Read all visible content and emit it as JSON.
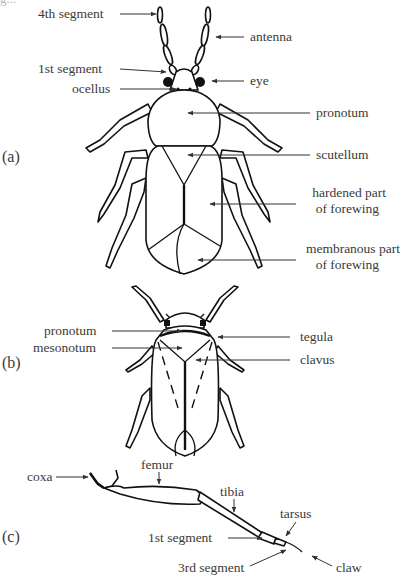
{
  "figure": {
    "cut_text": "g...",
    "panels": [
      {
        "tag": "(a)",
        "labels": {
          "fourth_segment": "4th segment",
          "antenna": "antenna",
          "first_segment": "1st segment",
          "eye": "eye",
          "ocellus": "ocellus",
          "pronotum": "pronotum",
          "scutellum": "scutellum",
          "hardened_1": "hardened part",
          "hardened_2": "of forewing",
          "membranous_1": "membranous part",
          "membranous_2": "of forewing"
        }
      },
      {
        "tag": "(b)",
        "labels": {
          "pronotum": "pronotum",
          "mesonotum": "mesonotum",
          "tegula": "tegula",
          "clavus": "clavus"
        }
      },
      {
        "tag": "(c)",
        "labels": {
          "coxa": "coxa",
          "femur": "femur",
          "tibia": "tibia",
          "tarsus": "tarsus",
          "first_segment": "1st segment",
          "third_segment": "3rd segment",
          "claw": "claw"
        }
      }
    ],
    "colors": {
      "line": "#111111",
      "label_text": "#3a3a3a",
      "background": "#ffffff"
    }
  }
}
